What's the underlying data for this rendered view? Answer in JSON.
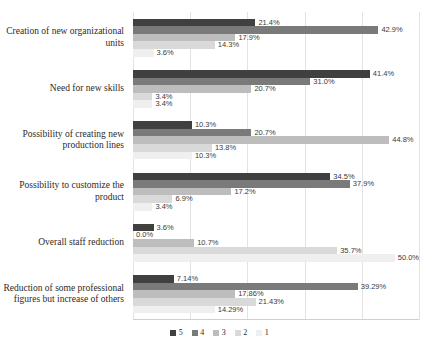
{
  "chart_data": {
    "type": "bar",
    "orientation": "horizontal",
    "title": "",
    "xlabel": "",
    "ylabel": "",
    "xlim": [
      0,
      50
    ],
    "grid": true,
    "gridlines": [
      0,
      10,
      20,
      30,
      40,
      50
    ],
    "legend_position": "bottom",
    "categories": [
      "Creation of new organizational units",
      "Need for new skills",
      "Possibility of creating new production lines",
      "Possibility to customize the product",
      "Overall staff reduction",
      "Reduction of some professional figures but increase of others"
    ],
    "series": [
      {
        "name": "5",
        "color": "#404040",
        "values": [
          21.4,
          41.4,
          10.3,
          34.5,
          3.6,
          7.14
        ],
        "labels": [
          "21.4%",
          "41.4%",
          "10.3%",
          "34.5%",
          "3.6%",
          "7.14%"
        ]
      },
      {
        "name": "4",
        "color": "#7a7a7a",
        "values": [
          42.9,
          31.0,
          20.7,
          37.9,
          0.0,
          39.29
        ],
        "labels": [
          "42.9%",
          "31.0%",
          "20.7%",
          "37.9%",
          "0.0%",
          "39.29%"
        ]
      },
      {
        "name": "3",
        "color": "#bdbdbd",
        "values": [
          17.9,
          20.7,
          44.8,
          17.2,
          10.7,
          17.86
        ],
        "labels": [
          "17.9%",
          "20.7%",
          "44.8%",
          "17.2%",
          "10.7%",
          "17.86%"
        ]
      },
      {
        "name": "2",
        "color": "#d9d9d9",
        "values": [
          14.3,
          3.4,
          13.8,
          6.9,
          35.7,
          21.43
        ],
        "labels": [
          "14.3%",
          "3.4%",
          "13.8%",
          "6.9%",
          "35.7%",
          "21.43%"
        ]
      },
      {
        "name": "1",
        "color": "#efefef",
        "values": [
          3.6,
          3.4,
          10.3,
          3.4,
          50.0,
          14.29
        ],
        "labels": [
          "3.6%",
          "3.4%",
          "10.3%",
          "3.4%",
          "50.0%",
          "14.29%"
        ]
      }
    ]
  },
  "legend": {
    "items": [
      {
        "label": "5",
        "color": "#404040"
      },
      {
        "label": "4",
        "color": "#7a7a7a"
      },
      {
        "label": "3",
        "color": "#bdbdbd"
      },
      {
        "label": "2",
        "color": "#d9d9d9"
      },
      {
        "label": "1",
        "color": "#efefef"
      }
    ]
  }
}
